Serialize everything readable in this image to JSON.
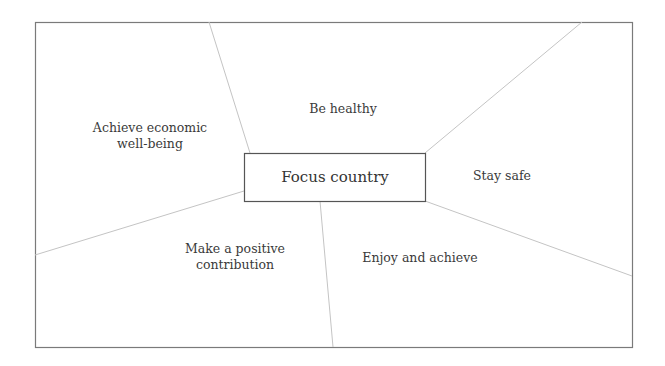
{
  "diagram": {
    "center": {
      "label": "Focus country"
    },
    "outcomes": [
      {
        "id": "be-healthy",
        "label": "Be healthy"
      },
      {
        "id": "stay-safe",
        "label": "Stay safe"
      },
      {
        "id": "enjoy-and-achieve",
        "label": "Enjoy and achieve"
      },
      {
        "id": "make-positive-contribution",
        "label_line1": "Make a positive",
        "label_line2": "contribution"
      },
      {
        "id": "achieve-economic-wellbeing",
        "label_line1": "Achieve economic",
        "label_line2": "well-being"
      }
    ],
    "colors": {
      "frame": "#7a7a7a",
      "divider": "#c4c4c4",
      "center_border": "#555555",
      "text": "#3a3a3a"
    }
  }
}
